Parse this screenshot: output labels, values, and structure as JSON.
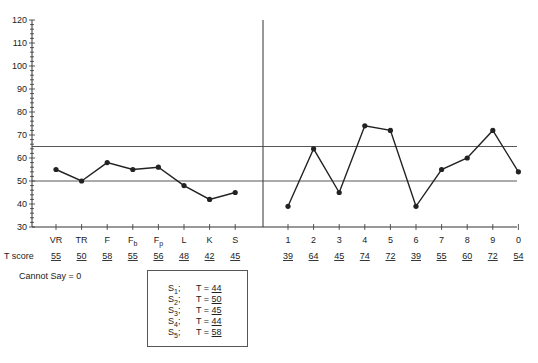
{
  "chart_data": {
    "type": "line",
    "title": "",
    "ylabel": "",
    "ylim": [
      30,
      120
    ],
    "yticks": [
      30,
      40,
      50,
      60,
      70,
      80,
      90,
      100,
      110,
      120
    ],
    "reference_lines": [
      50,
      65
    ],
    "validity_scales": {
      "categories": [
        "VR",
        "TR",
        "F",
        "Fb",
        "Fp",
        "L",
        "K",
        "S"
      ],
      "category_labels": [
        {
          "base": "VR",
          "sub": ""
        },
        {
          "base": "TR",
          "sub": ""
        },
        {
          "base": "F",
          "sub": ""
        },
        {
          "base": "F",
          "sub": "b"
        },
        {
          "base": "F",
          "sub": "p"
        },
        {
          "base": "L",
          "sub": ""
        },
        {
          "base": "K",
          "sub": ""
        },
        {
          "base": "S",
          "sub": ""
        }
      ],
      "values": [
        55,
        50,
        58,
        55,
        56,
        48,
        42,
        45
      ]
    },
    "clinical_scales": {
      "categories": [
        "1",
        "2",
        "3",
        "4",
        "5",
        "6",
        "7",
        "8",
        "9",
        "0"
      ],
      "values": [
        39,
        64,
        45,
        74,
        72,
        39,
        55,
        60,
        72,
        54
      ]
    },
    "row_label": "T score",
    "cannot_say": "Cannot Say = 0",
    "subscales": [
      {
        "name": "S",
        "sub": "1",
        "t": "44"
      },
      {
        "name": "S",
        "sub": "2",
        "t": "50"
      },
      {
        "name": "S",
        "sub": "3",
        "t": "45"
      },
      {
        "name": "S",
        "sub": "4",
        "t": "44"
      },
      {
        "name": "S",
        "sub": "5",
        "t": "58"
      }
    ]
  }
}
